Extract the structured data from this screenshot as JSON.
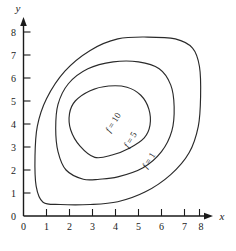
{
  "chart_data": {
    "type": "line",
    "title": "",
    "subtitle": "",
    "xlabel": "x",
    "ylabel": "y",
    "xlim": [
      0,
      8
    ],
    "ylim": [
      0,
      8
    ],
    "xticks": [
      "0",
      "1",
      "2",
      "3",
      "4",
      "5",
      "6",
      "7",
      "8"
    ],
    "yticks": [
      "0",
      "1",
      "2",
      "3",
      "4",
      "5",
      "6",
      "7",
      "8"
    ],
    "grid": false,
    "legend": "inline-contour-labels",
    "contours": [
      {
        "label": "f = 10",
        "level": 10,
        "label_text_f": "f",
        "label_text_rest": " = 10",
        "label_rotation_deg": -58,
        "label_at": [
          4.0,
          4.0
        ],
        "approx_points": [
          [
            3.1,
            2.55
          ],
          [
            2.45,
            3.05
          ],
          [
            2.05,
            3.75
          ],
          [
            2.0,
            4.45
          ],
          [
            2.25,
            5.0
          ],
          [
            2.9,
            5.45
          ],
          [
            3.7,
            5.65
          ],
          [
            4.5,
            5.6
          ],
          [
            5.1,
            5.25
          ],
          [
            5.45,
            4.65
          ],
          [
            5.5,
            3.95
          ],
          [
            5.25,
            3.4
          ],
          [
            4.6,
            2.95
          ],
          [
            3.85,
            2.65
          ],
          [
            3.1,
            2.55
          ]
        ]
      },
      {
        "label": "f = 5",
        "level": 5,
        "label_text_f": "f",
        "label_text_rest": " = 5",
        "label_rotation_deg": -58,
        "label_at": [
          4.75,
          3.25
        ],
        "approx_points": [
          [
            2.6,
            1.6
          ],
          [
            1.85,
            2.0
          ],
          [
            1.5,
            2.8
          ],
          [
            1.4,
            3.8
          ],
          [
            1.5,
            4.85
          ],
          [
            1.95,
            5.75
          ],
          [
            2.8,
            6.4
          ],
          [
            3.9,
            6.7
          ],
          [
            5.0,
            6.7
          ],
          [
            5.9,
            6.4
          ],
          [
            6.4,
            5.7
          ],
          [
            6.55,
            4.75
          ],
          [
            6.45,
            3.7
          ],
          [
            6.0,
            2.8
          ],
          [
            5.2,
            2.1
          ],
          [
            4.1,
            1.7
          ],
          [
            3.3,
            1.6
          ],
          [
            2.6,
            1.6
          ]
        ]
      },
      {
        "label": "f = 1",
        "level": 1,
        "label_text_f": "f",
        "label_text_rest": " = 1",
        "label_rotation_deg": -58,
        "label_at": [
          5.55,
          2.35
        ],
        "approx_points": [
          [
            1.6,
            0.5
          ],
          [
            0.85,
            0.6
          ],
          [
            0.55,
            1.3
          ],
          [
            0.5,
            2.6
          ],
          [
            0.6,
            3.9
          ],
          [
            1.0,
            5.1
          ],
          [
            1.8,
            6.3
          ],
          [
            2.9,
            7.2
          ],
          [
            4.1,
            7.7
          ],
          [
            5.4,
            7.78
          ],
          [
            6.6,
            7.7
          ],
          [
            7.35,
            7.3
          ],
          [
            7.65,
            6.5
          ],
          [
            7.7,
            5.2
          ],
          [
            7.6,
            3.9
          ],
          [
            7.2,
            2.75
          ],
          [
            6.4,
            1.8
          ],
          [
            5.3,
            1.05
          ],
          [
            4.1,
            0.62
          ],
          [
            2.9,
            0.5
          ],
          [
            1.6,
            0.5
          ]
        ]
      }
    ]
  },
  "axes": {
    "x_label": "x",
    "y_label": "y",
    "x_tick_labels": [
      "0",
      "1",
      "2",
      "3",
      "4",
      "5",
      "6",
      "7",
      "8"
    ],
    "y_tick_labels": [
      "0",
      "1",
      "2",
      "3",
      "4",
      "5",
      "6",
      "7",
      "8"
    ],
    "arrow_x": "arrow-right",
    "arrow_y": "arrow-up"
  },
  "style": {
    "background": "#ffffff",
    "line_color": "#2a2a2a",
    "axis_color": "#1a1a1a",
    "text_color": "#1a1a1a"
  }
}
